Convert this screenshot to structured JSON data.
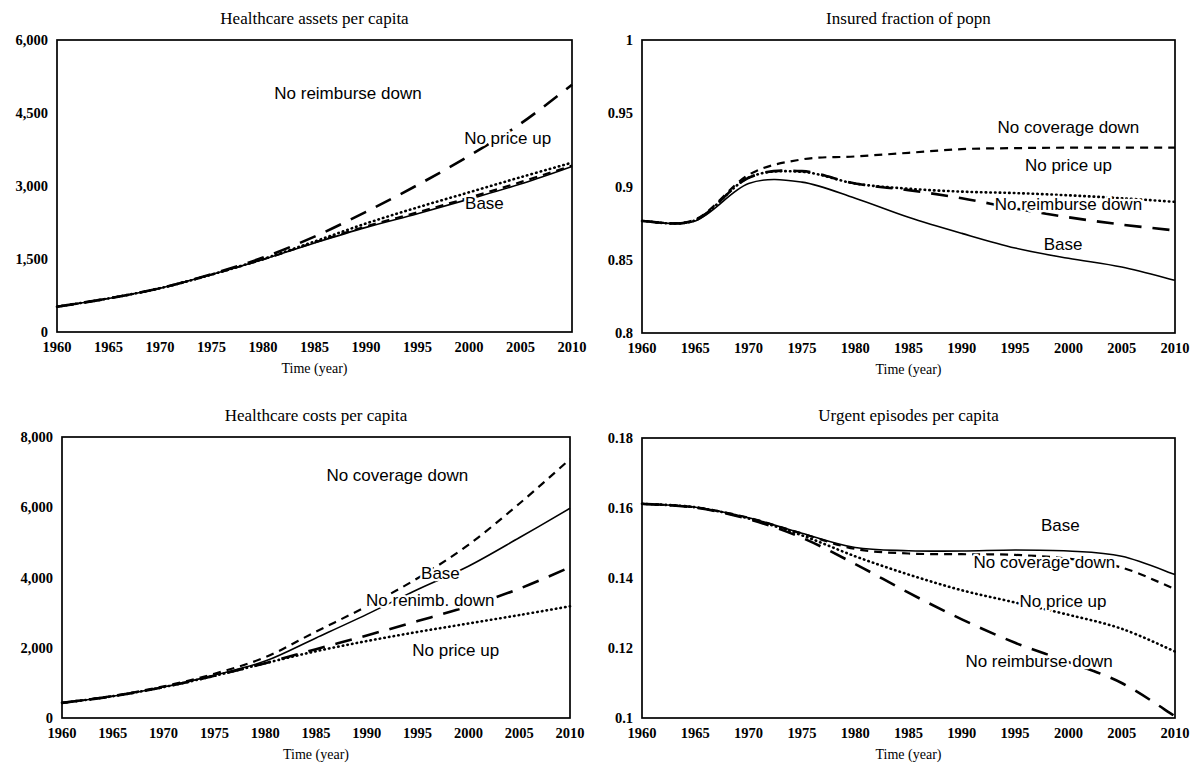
{
  "figure": {
    "panels": [
      {
        "id": "healthcare-assets",
        "title": "Healthcare assets per capita",
        "xlabel": "Time (year)",
        "ylabel": "",
        "yticks": [
          "0",
          "1,500",
          "3,000",
          "4,500",
          "6,000"
        ],
        "xticks": [
          "1960",
          "1965",
          "1970",
          "1975",
          "1980",
          "1985",
          "1990",
          "1995",
          "2000",
          "2005",
          "2010"
        ],
        "labels": [
          {
            "text": "No reimburse down",
            "x": 0.565,
            "y": 4790,
            "anchor": "middle"
          },
          {
            "text": "No price up",
            "x": 0.875,
            "y": 3870,
            "anchor": "middle"
          },
          {
            "text": "Base",
            "x": 0.83,
            "y": 2530,
            "anchor": "middle"
          }
        ]
      },
      {
        "id": "insured-fraction",
        "title": "Insured fraction of popn",
        "xlabel": "Time (year)",
        "ylabel": "",
        "yticks": [
          "0.8",
          "0.85",
          "0.9",
          "0.95",
          "1"
        ],
        "xticks": [
          "1960",
          "1965",
          "1970",
          "1975",
          "1980",
          "1985",
          "1990",
          "1995",
          "2000",
          "2005",
          "2010"
        ],
        "labels": [
          {
            "text": "No coverage down",
            "x": 0.8,
            "y": 0.9365,
            "anchor": "middle"
          },
          {
            "text": "No price up",
            "x": 0.8,
            "y": 0.9105,
            "anchor": "middle"
          },
          {
            "text": "No reimburse down",
            "x": 0.8,
            "y": 0.884,
            "anchor": "middle"
          },
          {
            "text": "Base",
            "x": 0.79,
            "y": 0.8565,
            "anchor": "middle"
          }
        ]
      },
      {
        "id": "healthcare-costs",
        "title": "Healthcare costs per capita",
        "xlabel": "Time (year)",
        "ylabel": "",
        "yticks": [
          "0",
          "2,000",
          "4,000",
          "6,000",
          "8,000"
        ],
        "xticks": [
          "1960",
          "1965",
          "1970",
          "1975",
          "1980",
          "1985",
          "1990",
          "1995",
          "2000",
          "2005",
          "2010"
        ],
        "labels": [
          {
            "text": "No coverage down",
            "x": 0.66,
            "y": 6750,
            "anchor": "middle"
          },
          {
            "text": "Base",
            "x": 0.745,
            "y": 3960,
            "anchor": "middle"
          },
          {
            "text": "No renimb. down",
            "x": 0.725,
            "y": 3180,
            "anchor": "middle"
          },
          {
            "text": "No price up",
            "x": 0.775,
            "y": 1770,
            "anchor": "middle"
          }
        ]
      },
      {
        "id": "urgent-episodes",
        "title": "Urgent episodes per capita",
        "xlabel": "Time (year)",
        "ylabel": "",
        "yticks": [
          "0.1",
          "0.12",
          "0.14",
          "0.16",
          "0.18"
        ],
        "xticks": [
          "1960",
          "1965",
          "1970",
          "1975",
          "1980",
          "1985",
          "1990",
          "1995",
          "2000",
          "2005",
          "2010"
        ],
        "labels": [
          {
            "text": "Base",
            "x": 0.785,
            "y": 0.1533,
            "anchor": "middle"
          },
          {
            "text": "No coverage down",
            "x": 0.755,
            "y": 0.143,
            "anchor": "middle"
          },
          {
            "text": "No price up",
            "x": 0.79,
            "y": 0.1318,
            "anchor": "middle"
          },
          {
            "text": "No reimburse down",
            "x": 0.745,
            "y": 0.1145,
            "anchor": "middle"
          }
        ]
      }
    ]
  },
  "chart_data": [
    {
      "type": "line",
      "title": "Healthcare assets per capita",
      "xlabel": "Time (year)",
      "ylabel": "",
      "xlim": [
        1960,
        2010
      ],
      "ylim": [
        0,
        6000
      ],
      "yticks": [
        0,
        1500,
        3000,
        4500,
        6000
      ],
      "xticks": [
        1960,
        1965,
        1970,
        1975,
        1980,
        1985,
        1990,
        1995,
        2000,
        2005,
        2010
      ],
      "grid": false,
      "legend": "inline-annotations",
      "x": [
        1960,
        1965,
        1970,
        1975,
        1980,
        1985,
        1990,
        1995,
        2000,
        2005,
        2010
      ],
      "series": [
        {
          "name": "Base",
          "style": "solid",
          "values": [
            520,
            690,
            900,
            1180,
            1490,
            1830,
            2150,
            2430,
            2730,
            3040,
            3400
          ]
        },
        {
          "name": "No price up",
          "style": "dotted",
          "values": [
            520,
            690,
            900,
            1180,
            1500,
            1860,
            2230,
            2560,
            2870,
            3180,
            3480
          ]
        },
        {
          "name": "No coverage down",
          "style": "dashed",
          "values": [
            520,
            690,
            900,
            1180,
            1490,
            1840,
            2170,
            2460,
            2760,
            3080,
            3420
          ]
        },
        {
          "name": "No reimburse down",
          "style": "longdash",
          "values": [
            520,
            690,
            900,
            1190,
            1530,
            1960,
            2470,
            3020,
            3620,
            4280,
            5080
          ]
        }
      ]
    },
    {
      "type": "line",
      "title": "Insured fraction of popn",
      "xlabel": "Time (year)",
      "ylabel": "",
      "xlim": [
        1960,
        2010
      ],
      "ylim": [
        0.8,
        1.0
      ],
      "yticks": [
        0.8,
        0.85,
        0.9,
        0.95,
        1
      ],
      "xticks": [
        1960,
        1965,
        1970,
        1975,
        1980,
        1985,
        1990,
        1995,
        2000,
        2005,
        2010
      ],
      "grid": false,
      "legend": "inline-annotations",
      "x": [
        1960,
        1965,
        1970,
        1975,
        1980,
        1985,
        1990,
        1995,
        2000,
        2005,
        2010
      ],
      "series": [
        {
          "name": "Base",
          "style": "solid",
          "values": [
            0.8765,
            0.8765,
            0.902,
            0.903,
            0.892,
            0.879,
            0.868,
            0.858,
            0.851,
            0.845,
            0.836
          ]
        },
        {
          "name": "No price up",
          "style": "dotted",
          "values": [
            0.8765,
            0.877,
            0.906,
            0.91,
            0.902,
            0.8985,
            0.8965,
            0.8955,
            0.894,
            0.892,
            0.8895
          ]
        },
        {
          "name": "No coverage down",
          "style": "dashed",
          "values": [
            0.8765,
            0.8775,
            0.908,
            0.9185,
            0.9205,
            0.923,
            0.9255,
            0.9262,
            0.9265,
            0.9265,
            0.9265
          ]
        },
        {
          "name": "No reimburse down",
          "style": "longdash",
          "values": [
            0.8765,
            0.877,
            0.906,
            0.9105,
            0.902,
            0.8975,
            0.892,
            0.885,
            0.879,
            0.874,
            0.87
          ]
        }
      ]
    },
    {
      "type": "line",
      "title": "Healthcare costs per capita",
      "xlabel": "Time (year)",
      "ylabel": "",
      "xlim": [
        1960,
        2010
      ],
      "ylim": [
        0,
        8000
      ],
      "yticks": [
        0,
        2000,
        4000,
        6000,
        8000
      ],
      "xticks": [
        1960,
        1965,
        1970,
        1975,
        1980,
        1985,
        1990,
        1995,
        2000,
        2005,
        2010
      ],
      "grid": false,
      "legend": "inline-annotations",
      "x": [
        1960,
        1965,
        1970,
        1975,
        1980,
        1985,
        1990,
        1995,
        2000,
        2005,
        2010
      ],
      "series": [
        {
          "name": "Base",
          "style": "solid",
          "values": [
            430,
            620,
            880,
            1220,
            1620,
            2280,
            2950,
            3660,
            4320,
            5130,
            5970
          ]
        },
        {
          "name": "No price up",
          "style": "dotted",
          "values": [
            430,
            620,
            880,
            1200,
            1560,
            1900,
            2190,
            2450,
            2690,
            2930,
            3180
          ]
        },
        {
          "name": "No coverage down",
          "style": "dashed",
          "values": [
            430,
            630,
            900,
            1260,
            1730,
            2460,
            3180,
            3980,
            4930,
            6100,
            7370
          ]
        },
        {
          "name": "No reimburse down",
          "style": "longdash",
          "values": [
            430,
            620,
            880,
            1200,
            1560,
            1960,
            2350,
            2760,
            3180,
            3680,
            4290
          ]
        }
      ]
    },
    {
      "type": "line",
      "title": "Urgent episodes per capita",
      "xlabel": "Time (year)",
      "ylabel": "",
      "xlim": [
        1960,
        2010
      ],
      "ylim": [
        0.1,
        0.18
      ],
      "yticks": [
        0.1,
        0.12,
        0.14,
        0.16,
        0.18
      ],
      "xticks": [
        1960,
        1965,
        1970,
        1975,
        1980,
        1985,
        1990,
        1995,
        2000,
        2005,
        2010
      ],
      "grid": false,
      "legend": "inline-annotations",
      "x": [
        1960,
        1965,
        1970,
        1975,
        1980,
        1985,
        1990,
        1995,
        2000,
        2005,
        2010
      ],
      "series": [
        {
          "name": "Base",
          "style": "solid",
          "values": [
            0.1612,
            0.1602,
            0.1572,
            0.1528,
            0.1487,
            0.1478,
            0.1477,
            0.148,
            0.1477,
            0.1462,
            0.141
          ]
        },
        {
          "name": "No price up",
          "style": "dotted",
          "values": [
            0.1612,
            0.1602,
            0.157,
            0.1522,
            0.1462,
            0.141,
            0.1365,
            0.133,
            0.1295,
            0.1255,
            0.119
          ]
        },
        {
          "name": "No coverage down",
          "style": "dashed",
          "values": [
            0.1612,
            0.1602,
            0.1572,
            0.1527,
            0.1483,
            0.147,
            0.1468,
            0.1466,
            0.1455,
            0.143,
            0.1368
          ]
        },
        {
          "name": "No reimburse down",
          "style": "longdash",
          "values": [
            0.1612,
            0.1601,
            0.1568,
            0.1515,
            0.144,
            0.1358,
            0.1282,
            0.1215,
            0.116,
            0.11,
            0.1005
          ]
        }
      ]
    }
  ]
}
